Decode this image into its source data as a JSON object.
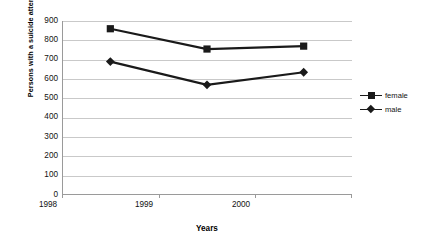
{
  "chart_data": {
    "type": "line",
    "title": "",
    "xlabel": "Years",
    "ylabel": "Persons with a suicide attempt/100,000",
    "categories": [
      "1998",
      "1999",
      "2000"
    ],
    "series": [
      {
        "name": "female",
        "marker": "square",
        "values": [
          860,
          755,
          770
        ]
      },
      {
        "name": "male",
        "marker": "diamond",
        "values": [
          690,
          570,
          635
        ]
      }
    ],
    "ylim": [
      0,
      900
    ],
    "ytick_step": 100,
    "yticks": [
      "900",
      "800",
      "700",
      "600",
      "500",
      "400",
      "300",
      "200",
      "100",
      "0"
    ],
    "grid": true,
    "legend_position": "right",
    "series_color": "#1a1a1a",
    "grid_color": "#c9c9c9",
    "axis_color": "#9a9a9a",
    "background": "#ffffff"
  },
  "legend": {
    "items": [
      {
        "label": "female"
      },
      {
        "label": "male"
      }
    ]
  }
}
